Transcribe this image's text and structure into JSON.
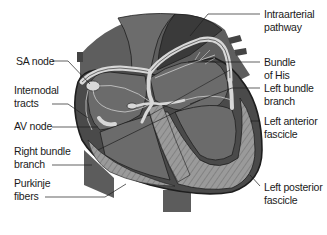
{
  "diagram": {
    "colors": {
      "outer_wall": "#4a4a4a",
      "chamber": "#6b6b6b",
      "dark_vessel": "#3a3a3a",
      "mid_vessel": "#7a7a7a",
      "pathway": "#d8d8d8",
      "purkinje_zone": "#9a9a9a",
      "outline": "#1e1e1e",
      "label_text": "#1a1a1a"
    },
    "labels_left": [
      {
        "id": "sa-node",
        "lines": [
          "SA node"
        ]
      },
      {
        "id": "internodal-tracts",
        "lines": [
          "Internodal",
          "tracts"
        ]
      },
      {
        "id": "av-node",
        "lines": [
          "AV node"
        ]
      },
      {
        "id": "right-bundle-branch",
        "lines": [
          "Right bundle",
          "branch"
        ]
      },
      {
        "id": "purkinje-fibers",
        "lines": [
          "Purkinje",
          "fibers"
        ]
      }
    ],
    "labels_right": [
      {
        "id": "intraarterial-pathway",
        "lines": [
          "Intraarterial",
          "pathway"
        ]
      },
      {
        "id": "bundle-of-his",
        "lines": [
          "Bundle",
          "of His"
        ]
      },
      {
        "id": "left-bundle-branch",
        "lines": [
          "Left bundle",
          "branch"
        ]
      },
      {
        "id": "left-anterior-fascicle",
        "lines": [
          "Left anterior",
          "fascicle"
        ]
      },
      {
        "id": "left-posterior-fascicle",
        "lines": [
          "Left posterior",
          "fascicle"
        ]
      }
    ]
  }
}
